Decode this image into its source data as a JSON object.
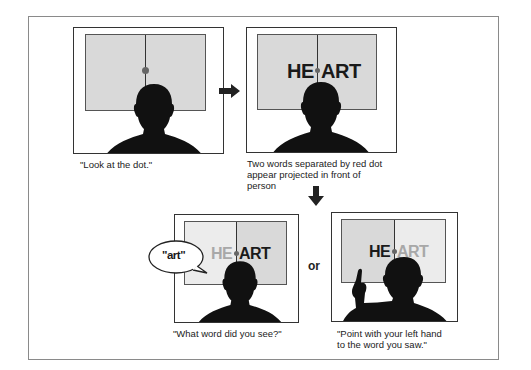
{
  "panels": [
    {
      "id": "look-at-dot",
      "caption": "\"Look at the dot.\""
    },
    {
      "id": "projected-words",
      "word_left": "HE",
      "word_right": "ART",
      "caption_lines": [
        "Two words separated by red dot",
        "appear projected in front of",
        "person"
      ]
    },
    {
      "id": "verbal-response",
      "word_left": "HE",
      "word_right": "ART",
      "speech": "\"art\"",
      "caption": "\"What word did you see?\""
    },
    {
      "id": "point-response",
      "word_left": "HE",
      "word_right": "ART",
      "caption_lines": [
        "\"Point with your left hand",
        "to the word you saw.\""
      ]
    }
  ],
  "connector": {
    "or_label": "or"
  },
  "colors": {
    "screen_gray": "#d9d9d9",
    "screen_light": "#ececec",
    "silhouette": "#111111",
    "dot": "#6e6e6e",
    "faded_text": "#a8a8a8",
    "strong_text": "#1a1a1a"
  }
}
